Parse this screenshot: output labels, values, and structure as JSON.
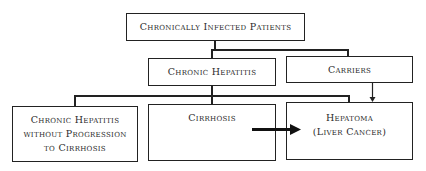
{
  "diagram": {
    "root": {
      "label": "Chronically Infected Patients"
    },
    "level2": [
      {
        "label": "Chronic Hepatitis"
      },
      {
        "label": "Carriers"
      }
    ],
    "level3": [
      {
        "lines": [
          "Chronic Hepatitis",
          "without Progression",
          "to Cirrhosis"
        ]
      },
      {
        "lines": [
          "Cirrhosis"
        ]
      },
      {
        "lines": [
          "Hepatoma",
          "(Liver Cancer)"
        ]
      }
    ],
    "edges": [
      {
        "from": "Chronically Infected Patients",
        "to": "Chronic Hepatitis",
        "type": "line"
      },
      {
        "from": "Chronically Infected Patients",
        "to": "Carriers",
        "type": "line"
      },
      {
        "from": "Chronic Hepatitis",
        "to": "Chronic Hepatitis without Progression to Cirrhosis",
        "type": "line"
      },
      {
        "from": "Chronic Hepatitis",
        "to": "Cirrhosis",
        "type": "line"
      },
      {
        "from": "Chronic Hepatitis",
        "to": "Hepatoma (Liver Cancer)",
        "type": "line"
      },
      {
        "from": "Carriers",
        "to": "Hepatoma (Liver Cancer)",
        "type": "thin-arrow"
      },
      {
        "from": "Cirrhosis",
        "to": "Hepatoma (Liver Cancer)",
        "type": "thick-arrow"
      }
    ]
  }
}
